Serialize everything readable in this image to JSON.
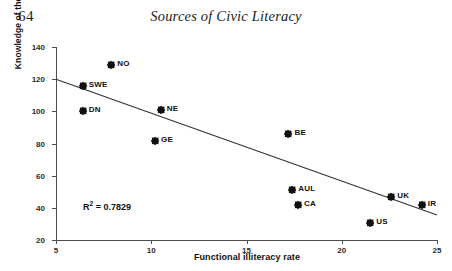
{
  "page": {
    "folio": "64",
    "running_head": "Sources of Civic Literacy"
  },
  "chart_data": {
    "type": "scatter",
    "title": "",
    "xlabel": "Functional illiteracy rate",
    "ylabel": "Knowledge of the United Nations",
    "xlim": [
      5,
      25
    ],
    "ylim": [
      20,
      140
    ],
    "xticks": [
      5,
      10,
      15,
      20,
      25
    ],
    "yticks": [
      20,
      40,
      60,
      80,
      100,
      120,
      140
    ],
    "grid": false,
    "legend": null,
    "annotations": [
      {
        "name": "r-squared",
        "text_prefix": "R",
        "text_sup": "2",
        "text_suffix": " = 0.7829",
        "value": 0.7829
      }
    ],
    "trendline": {
      "type": "linear",
      "x_start": 5,
      "y_start": 120,
      "x_end": 25,
      "y_end": 35.5,
      "r_squared": 0.7829
    },
    "points": [
      {
        "label": "NO",
        "x": 7.9,
        "y": 129
      },
      {
        "label": "SWE",
        "x": 6.4,
        "y": 116
      },
      {
        "label": "DN",
        "x": 6.4,
        "y": 100.5
      },
      {
        "label": "NE",
        "x": 10.5,
        "y": 101
      },
      {
        "label": "GE",
        "x": 10.2,
        "y": 81.5
      },
      {
        "label": "BE",
        "x": 17.2,
        "y": 86
      },
      {
        "label": "AUL",
        "x": 17.4,
        "y": 51
      },
      {
        "label": "CA",
        "x": 17.7,
        "y": 42
      },
      {
        "label": "UK",
        "x": 22.6,
        "y": 47
      },
      {
        "label": "IR",
        "x": 24.2,
        "y": 42
      },
      {
        "label": "US",
        "x": 21.5,
        "y": 30.5
      }
    ]
  }
}
